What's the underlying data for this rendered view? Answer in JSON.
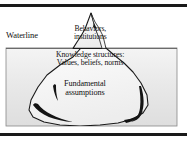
{
  "figure": {
    "type": "iceberg-diagram"
  },
  "rules": {
    "top": "horizontal-rule",
    "bottom": "horizontal-rule"
  },
  "scene": {
    "waterline_label": "Waterline",
    "water_fill": "#e9e9e9",
    "water_border": "#808080",
    "iceberg_fill": "#f2f2f2",
    "iceberg_outline": "#1a1a1a",
    "crevasse_fill": "#111111",
    "background": "#ffffff"
  },
  "layers": [
    {
      "id": "above-water",
      "position": "above-waterline",
      "lines": [
        "Behaviors,",
        "institutions"
      ]
    },
    {
      "id": "mid-water",
      "position": "just-below-waterline",
      "lines": [
        "Knowledge structures:",
        "Values, beliefs, norms"
      ]
    },
    {
      "id": "deep-water",
      "position": "deep-below-waterline",
      "lines": [
        "Fundamental",
        "assumptions"
      ]
    }
  ]
}
